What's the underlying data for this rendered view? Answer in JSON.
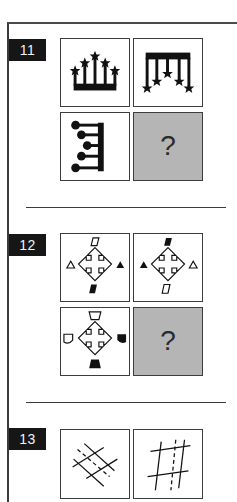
{
  "questions": [
    {
      "number": "11",
      "panels": [
        {
          "figure": "crown-five-stars-up"
        },
        {
          "figure": "comb-five-stars-down"
        },
        {
          "figure": "comb-five-dots-left"
        },
        {
          "figure": "unknown",
          "label": "?"
        }
      ]
    },
    {
      "number": "12",
      "panels": [
        {
          "figure": "cross-arrows-open-triangle-left-filled-triangle-right"
        },
        {
          "figure": "cross-arrows-filled-triangle-left-open-triangle-right"
        },
        {
          "figure": "cross-arrows-open-shields-top-left-filled-shields-right-bottom"
        },
        {
          "figure": "unknown",
          "label": "?"
        }
      ]
    },
    {
      "number": "13",
      "panels": [
        {
          "figure": "diagonal-lattice-dashed"
        },
        {
          "figure": "hash-grid-dashed"
        }
      ]
    }
  ],
  "colors": {
    "label_bg": "#161616",
    "label_text": "#f2f2f2",
    "answer_panel_bg": "#b5b5b5",
    "line": "#3a3a3a"
  }
}
